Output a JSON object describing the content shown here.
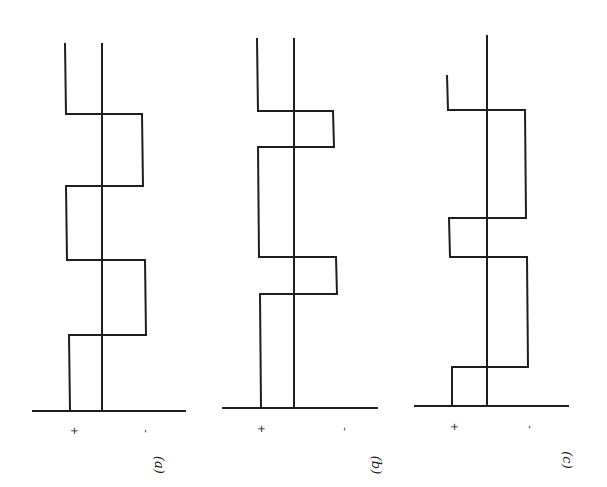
{
  "figure": {
    "line_color": "#1e1e1e",
    "background": "#ffffff",
    "panels": [
      {
        "id": "a",
        "label": "(a)",
        "plus_label": "+",
        "minus_label": "-",
        "axis": {
          "x": 102,
          "y_top": 43,
          "y_bottom": 411
        },
        "baseline": {
          "x1": 32,
          "x2": 186,
          "y": 411
        },
        "levels": {
          "plus_x": 66,
          "minus_x": 143
        },
        "wave_points": [
          [
            65,
            43
          ],
          [
            66,
            114
          ],
          [
            142,
            114
          ],
          [
            143,
            186
          ],
          [
            66,
            186
          ],
          [
            67,
            260
          ],
          [
            145,
            260
          ],
          [
            146,
            335
          ],
          [
            69,
            335
          ],
          [
            70,
            411
          ]
        ],
        "sign_pos": {
          "plus": [
            71,
            431
          ],
          "minus": [
            146,
            431
          ]
        },
        "label_pos": [
          158,
          465
        ]
      },
      {
        "id": "b",
        "label": "(b)",
        "plus_label": "+",
        "minus_label": "-",
        "axis": {
          "x": 294,
          "y_top": 38,
          "y_bottom": 408
        },
        "baseline": {
          "x1": 222,
          "x2": 378,
          "y": 408
        },
        "levels": {
          "plus_x": 258,
          "minus_x": 334
        },
        "wave_points": [
          [
            257,
            38
          ],
          [
            258,
            111
          ],
          [
            333,
            111
          ],
          [
            334,
            147
          ],
          [
            258,
            147
          ],
          [
            259,
            257
          ],
          [
            336,
            257
          ],
          [
            337,
            294
          ],
          [
            260,
            294
          ],
          [
            261,
            408
          ]
        ],
        "sign_pos": {
          "plus": [
            258,
            429
          ],
          "minus": [
            345,
            429
          ]
        },
        "label_pos": [
          375,
          465
        ]
      },
      {
        "id": "c",
        "label": "(c)",
        "plus_label": "+",
        "minus_label": "-",
        "axis": {
          "x": 487,
          "y_top": 35,
          "y_bottom": 406
        },
        "baseline": {
          "x1": 414,
          "x2": 569,
          "y": 406
        },
        "levels": {
          "plus_x": 450,
          "minus_x": 526
        },
        "wave_points": [
          [
            447,
            75
          ],
          [
            448,
            110
          ],
          [
            525,
            110
          ],
          [
            526,
            218
          ],
          [
            449,
            218
          ],
          [
            450,
            257
          ],
          [
            527,
            257
          ],
          [
            528,
            367
          ],
          [
            452,
            367
          ],
          [
            452,
            406
          ]
        ],
        "sign_pos": {
          "plus": [
            451,
            427
          ],
          "minus": [
            530,
            427
          ]
        },
        "label_pos": [
          566,
          460
        ]
      }
    ]
  }
}
